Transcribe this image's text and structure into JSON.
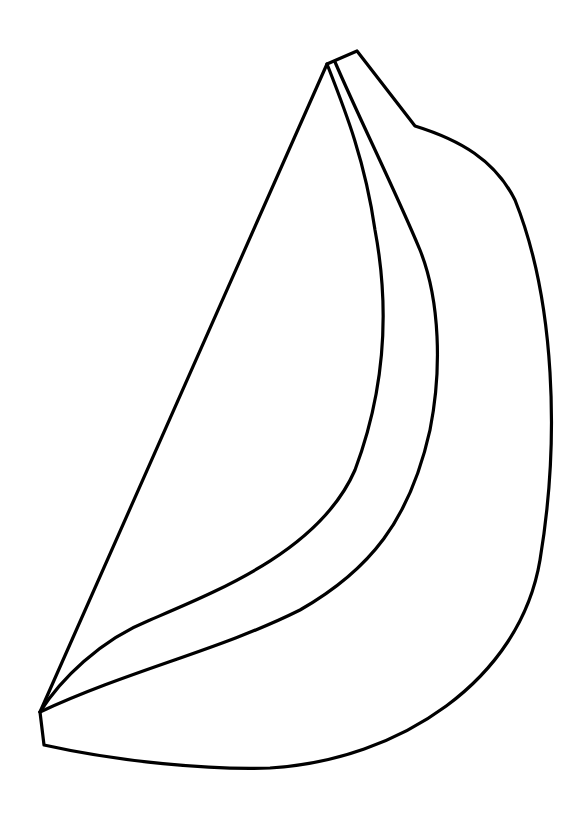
{
  "image": {
    "subject": "banana",
    "style": "black line drawing on white background (coloring page)",
    "background_color": "#ffffff",
    "stroke_color": "#000000",
    "stroke_width": 3.2
  },
  "shapes": {
    "outline": "M40,712 L44,745 C120,762 210,770 270,768 C400,760 520,680 540,560 C560,440 555,300 515,200 C495,160 460,140 415,126 L357,51 L327,64 Z",
    "inner_ridge_left": "M327,64 C345,110 365,160 375,230 C390,310 385,390 355,470 C320,550 220,590 150,620 C100,640 60,680 40,712",
    "inner_ridge_right": "M335,62 C360,120 395,190 420,250 C440,300 442,370 430,430 C410,520 370,570 300,610 C220,650 130,670 40,712"
  },
  "caption": "Banana line drawing"
}
